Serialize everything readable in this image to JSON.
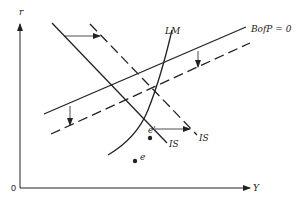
{
  "diagram": {
    "type": "IS-LM-BP diagram",
    "axes": {
      "y_label": "r",
      "x_label": "Y",
      "origin_label": "0"
    },
    "curves": {
      "is_original": {
        "label": "IS",
        "style": "solid"
      },
      "is_shifted": {
        "label": "IS",
        "style": "dashed"
      },
      "lm": {
        "label": "LM",
        "style": "solid"
      },
      "bp_original": {
        "label": "BofP = 0",
        "style": "solid"
      },
      "bp_shifted": {
        "label": "",
        "style": "dashed"
      }
    },
    "points": {
      "e": "e",
      "e_prime": "e'"
    },
    "shifts": {
      "is_shift": "rightward",
      "bp_shift": "downward"
    },
    "colors": {
      "line": "#222222",
      "background": "#ffffff"
    }
  }
}
